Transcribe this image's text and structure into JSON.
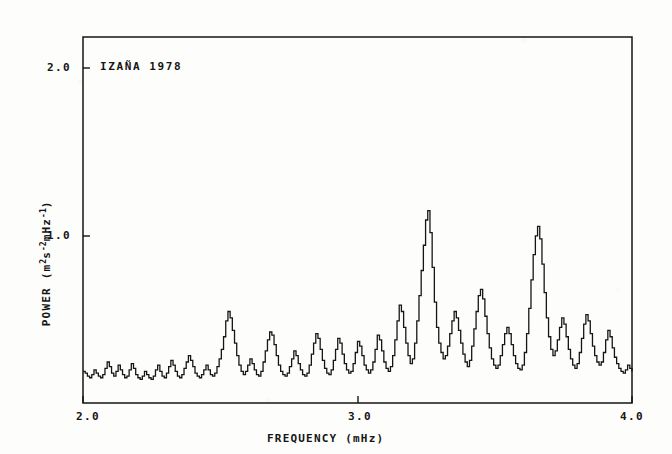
{
  "figure": {
    "annotation": "IZAÑA  1978",
    "background_color": "#fdfdfc",
    "ink_color": "#151515"
  },
  "axes": {
    "x_label": "FREQUENCY (mHz)",
    "x_ticks": [
      "2.0",
      "3.0",
      "4.0"
    ],
    "y_label_prefix": "POWER (m",
    "y_label_sup1": "2",
    "y_label_mid": "s",
    "y_label_sup2": "-2",
    "y_label_mid2": "mHz",
    "y_label_sup3": "-1",
    "y_label_suffix": ")",
    "y_ticks": [
      "2.0",
      "1.0"
    ]
  },
  "chart_data": {
    "type": "line",
    "title": "IZAÑA  1978",
    "xlabel": "FREQUENCY (mHz)",
    "ylabel": "POWER (m^2 s^-2 mHz^-1)",
    "xlim": [
      2.0,
      4.0
    ],
    "ylim": [
      0.0,
      2.32
    ],
    "xticks": [
      2.0,
      3.0,
      4.0
    ],
    "yticks": [
      1.0,
      2.0
    ],
    "grid": false,
    "legend": null,
    "series_name": "Solar p-mode power spectrum",
    "line_color": "#151515",
    "line_width": 1.3,
    "step_style": "post",
    "x": [
      2.0,
      2.008,
      2.016,
      2.024,
      2.032,
      2.04,
      2.048,
      2.056,
      2.064,
      2.072,
      2.08,
      2.088,
      2.096,
      2.104,
      2.112,
      2.12,
      2.128,
      2.136,
      2.144,
      2.152,
      2.16,
      2.168,
      2.176,
      2.184,
      2.192,
      2.2,
      2.208,
      2.216,
      2.224,
      2.232,
      2.24,
      2.248,
      2.256,
      2.264,
      2.272,
      2.28,
      2.288,
      2.296,
      2.304,
      2.312,
      2.32,
      2.328,
      2.336,
      2.344,
      2.352,
      2.36,
      2.368,
      2.376,
      2.384,
      2.392,
      2.4,
      2.408,
      2.416,
      2.424,
      2.432,
      2.44,
      2.448,
      2.456,
      2.464,
      2.472,
      2.48,
      2.488,
      2.496,
      2.504,
      2.512,
      2.52,
      2.528,
      2.536,
      2.544,
      2.552,
      2.56,
      2.568,
      2.576,
      2.584,
      2.592,
      2.6,
      2.608,
      2.616,
      2.624,
      2.632,
      2.64,
      2.648,
      2.656,
      2.664,
      2.672,
      2.68,
      2.688,
      2.696,
      2.704,
      2.712,
      2.72,
      2.728,
      2.736,
      2.744,
      2.752,
      2.76,
      2.768,
      2.776,
      2.784,
      2.792,
      2.8,
      2.808,
      2.816,
      2.824,
      2.832,
      2.84,
      2.848,
      2.856,
      2.864,
      2.872,
      2.88,
      2.888,
      2.896,
      2.904,
      2.912,
      2.92,
      2.928,
      2.936,
      2.944,
      2.952,
      2.96,
      2.968,
      2.976,
      2.984,
      2.992,
      3.0,
      3.008,
      3.016,
      3.024,
      3.032,
      3.04,
      3.048,
      3.056,
      3.064,
      3.072,
      3.08,
      3.088,
      3.096,
      3.104,
      3.112,
      3.12,
      3.128,
      3.136,
      3.144,
      3.152,
      3.16,
      3.168,
      3.176,
      3.184,
      3.192,
      3.2,
      3.208,
      3.216,
      3.224,
      3.232,
      3.24,
      3.248,
      3.256,
      3.264,
      3.272,
      3.28,
      3.288,
      3.296,
      3.304,
      3.312,
      3.32,
      3.328,
      3.336,
      3.344,
      3.352,
      3.36,
      3.368,
      3.376,
      3.384,
      3.392,
      3.4,
      3.408,
      3.416,
      3.424,
      3.432,
      3.44,
      3.448,
      3.456,
      3.464,
      3.472,
      3.48,
      3.488,
      3.496,
      3.504,
      3.512,
      3.52,
      3.528,
      3.536,
      3.544,
      3.552,
      3.56,
      3.568,
      3.576,
      3.584,
      3.592,
      3.6,
      3.608,
      3.616,
      3.624,
      3.632,
      3.64,
      3.648,
      3.656,
      3.664,
      3.672,
      3.68,
      3.688,
      3.696,
      3.704,
      3.712,
      3.72,
      3.728,
      3.736,
      3.744,
      3.752,
      3.76,
      3.768,
      3.776,
      3.784,
      3.792,
      3.8,
      3.808,
      3.816,
      3.824,
      3.832,
      3.84,
      3.848,
      3.856,
      3.864,
      3.872,
      3.88,
      3.888,
      3.896,
      3.904,
      3.912,
      3.92,
      3.928,
      3.936,
      3.944,
      3.952,
      3.96,
      3.968,
      3.976,
      3.984,
      3.992,
      4.0
    ],
    "y": [
      0.2,
      0.19,
      0.17,
      0.16,
      0.18,
      0.21,
      0.19,
      0.17,
      0.16,
      0.18,
      0.22,
      0.26,
      0.23,
      0.19,
      0.17,
      0.2,
      0.24,
      0.21,
      0.18,
      0.16,
      0.17,
      0.21,
      0.25,
      0.22,
      0.18,
      0.16,
      0.15,
      0.17,
      0.2,
      0.18,
      0.16,
      0.15,
      0.17,
      0.21,
      0.24,
      0.2,
      0.17,
      0.16,
      0.19,
      0.23,
      0.27,
      0.24,
      0.2,
      0.17,
      0.16,
      0.18,
      0.22,
      0.26,
      0.3,
      0.27,
      0.23,
      0.19,
      0.17,
      0.16,
      0.18,
      0.21,
      0.24,
      0.21,
      0.18,
      0.17,
      0.19,
      0.23,
      0.28,
      0.34,
      0.42,
      0.52,
      0.58,
      0.54,
      0.46,
      0.38,
      0.3,
      0.24,
      0.2,
      0.18,
      0.2,
      0.24,
      0.28,
      0.25,
      0.21,
      0.18,
      0.17,
      0.2,
      0.26,
      0.33,
      0.4,
      0.45,
      0.43,
      0.37,
      0.3,
      0.24,
      0.2,
      0.18,
      0.17,
      0.19,
      0.23,
      0.28,
      0.33,
      0.3,
      0.25,
      0.21,
      0.18,
      0.17,
      0.19,
      0.24,
      0.31,
      0.38,
      0.44,
      0.41,
      0.34,
      0.27,
      0.22,
      0.19,
      0.18,
      0.21,
      0.27,
      0.34,
      0.41,
      0.38,
      0.31,
      0.25,
      0.21,
      0.19,
      0.2,
      0.25,
      0.32,
      0.39,
      0.36,
      0.3,
      0.24,
      0.21,
      0.19,
      0.21,
      0.26,
      0.34,
      0.43,
      0.4,
      0.33,
      0.26,
      0.22,
      0.2,
      0.23,
      0.3,
      0.4,
      0.52,
      0.62,
      0.58,
      0.48,
      0.38,
      0.3,
      0.25,
      0.28,
      0.38,
      0.52,
      0.68,
      0.84,
      1.0,
      1.16,
      1.22,
      1.08,
      0.86,
      0.64,
      0.48,
      0.38,
      0.32,
      0.28,
      0.3,
      0.36,
      0.44,
      0.52,
      0.58,
      0.54,
      0.46,
      0.38,
      0.31,
      0.26,
      0.23,
      0.27,
      0.36,
      0.47,
      0.58,
      0.68,
      0.72,
      0.66,
      0.55,
      0.44,
      0.35,
      0.28,
      0.24,
      0.22,
      0.24,
      0.3,
      0.37,
      0.44,
      0.48,
      0.44,
      0.37,
      0.3,
      0.25,
      0.22,
      0.21,
      0.24,
      0.32,
      0.44,
      0.6,
      0.78,
      0.94,
      1.06,
      1.12,
      1.04,
      0.88,
      0.7,
      0.54,
      0.42,
      0.34,
      0.3,
      0.33,
      0.4,
      0.48,
      0.54,
      0.5,
      0.42,
      0.34,
      0.28,
      0.24,
      0.22,
      0.25,
      0.32,
      0.41,
      0.5,
      0.56,
      0.52,
      0.44,
      0.36,
      0.3,
      0.26,
      0.24,
      0.26,
      0.32,
      0.4,
      0.46,
      0.42,
      0.35,
      0.29,
      0.25,
      0.22,
      0.2,
      0.19,
      0.21,
      0.24,
      0.22,
      0.2
    ]
  }
}
